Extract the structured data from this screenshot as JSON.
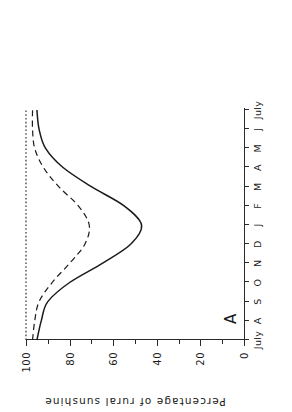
{
  "figure": {
    "panel_label": "A",
    "background_color": "#ffffff",
    "ink_color": "#1a1a1a",
    "orientation": "rotated-90-ccw"
  },
  "chart_data": {
    "type": "line",
    "title": "",
    "subtitle": "",
    "xlabel": "",
    "ylabel": "Percentage of rural sunshine",
    "panel_label": "A",
    "grid": false,
    "legend": "none",
    "xlim": [
      0,
      12
    ],
    "ylim": [
      0,
      100
    ],
    "yticks": [
      0,
      20,
      40,
      60,
      80,
      100
    ],
    "ytick_labels": [
      "0",
      "20",
      "40",
      "60",
      "80",
      "100"
    ],
    "yticks_minor": [
      10,
      30,
      50,
      70,
      90
    ],
    "categories": [
      "July",
      "A",
      "S",
      "O",
      "N",
      "D",
      "J",
      "F",
      "M",
      "A",
      "M",
      "J",
      "July"
    ],
    "x": [
      0,
      1,
      2,
      3,
      4,
      5,
      6,
      7,
      8,
      9,
      10,
      11,
      12
    ],
    "series": [
      {
        "name": "rural reference",
        "style": "dotted",
        "color": "#1a1a1a",
        "values": [
          100,
          100,
          100,
          100,
          100,
          100,
          100,
          100,
          100,
          100,
          100,
          100,
          100
        ]
      },
      {
        "name": "suburban",
        "style": "dashed",
        "color": "#1a1a1a",
        "values": [
          97,
          96,
          94,
          88,
          80,
          73,
          71,
          76,
          85,
          92,
          96,
          97,
          97
        ]
      },
      {
        "name": "urban centre",
        "style": "solid",
        "color": "#1a1a1a",
        "values": [
          95,
          93,
          90,
          80,
          65,
          52,
          47,
          55,
          70,
          83,
          91,
          94,
          95
        ]
      }
    ]
  }
}
